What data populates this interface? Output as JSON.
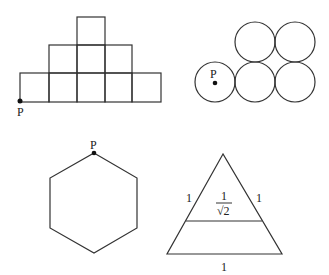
{
  "figures": {
    "squares": {
      "point_label": "P"
    },
    "circles": {
      "point_label": "P"
    },
    "hexagon": {
      "point_label": "P"
    },
    "triangle": {
      "left_side_label": "1",
      "right_side_label": "1",
      "inner_fraction_numerator": "1",
      "inner_fraction_denominator": "√2",
      "base_label": "1"
    }
  },
  "colors": {
    "stroke": "#333333",
    "background": "#ffffff"
  }
}
